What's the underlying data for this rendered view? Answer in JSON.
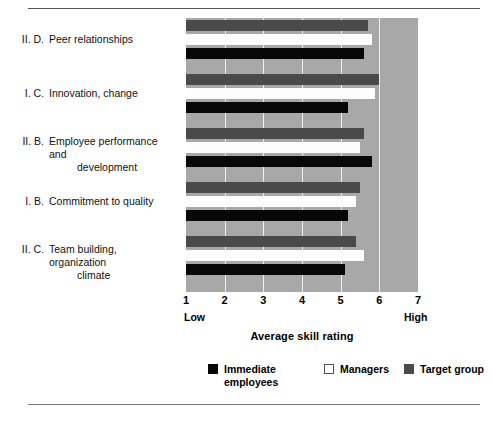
{
  "chart_data": {
    "type": "bar",
    "orientation": "horizontal",
    "title": "",
    "xlabel": "Average skill rating",
    "ylabel": "",
    "xlim": [
      1,
      7
    ],
    "xticks": [
      1,
      2,
      3,
      4,
      5,
      6,
      7
    ],
    "xtick_labels": [
      "1",
      "2",
      "3",
      "4",
      "5",
      "6",
      "7"
    ],
    "axis_low_label": "Low",
    "axis_high_label": "High",
    "grid": true,
    "legend_position": "bottom",
    "categories": [
      "II.  D.  Peer relationships",
      "I.  C.  Innovation, change",
      "II.  B.  Employee performance and development",
      "I.  B.  Commitment to quality",
      "II.  C.  Team building, organization climate"
    ],
    "series": [
      {
        "name": "Immediate employees",
        "color": "#080808",
        "values": [
          5.6,
          5.2,
          5.8,
          5.2,
          5.1
        ]
      },
      {
        "name": "Managers",
        "color": "#ffffff",
        "values": [
          5.8,
          5.9,
          5.5,
          5.4,
          5.6
        ]
      },
      {
        "name": "Target group",
        "color": "#4a4a4a",
        "values": [
          5.7,
          6.0,
          5.6,
          5.5,
          5.4
        ]
      }
    ]
  },
  "categories_display": [
    {
      "numeral": "II.  D.",
      "line1": "Peer relationships",
      "line2": ""
    },
    {
      "numeral": "I.  C.",
      "line1": "Innovation, change",
      "line2": ""
    },
    {
      "numeral": "II.  B.",
      "line1": "Employee performance and",
      "line2": "development"
    },
    {
      "numeral": "I.  B.",
      "line1": "Commitment to quality",
      "line2": ""
    },
    {
      "numeral": "II.  C.",
      "line1": "Team building, organization",
      "line2": "climate"
    }
  ],
  "axis": {
    "title": "Average skill rating",
    "low": "Low",
    "high": "High",
    "ticks": [
      "1",
      "2",
      "3",
      "4",
      "5",
      "6",
      "7"
    ]
  },
  "legend": {
    "items": [
      {
        "label_line1": "Immediate",
        "label_line2": "employees",
        "color": "#080808"
      },
      {
        "label_line1": "Managers",
        "label_line2": "",
        "color": "#ffffff"
      },
      {
        "label_line1": "Target group",
        "label_line2": "",
        "color": "#4a4a4a"
      }
    ]
  },
  "colors": {
    "plot_background": "#a8a8a8",
    "gridline": "#efefef",
    "immediate": "#080808",
    "managers": "#ffffff",
    "target": "#4a4a4a"
  }
}
